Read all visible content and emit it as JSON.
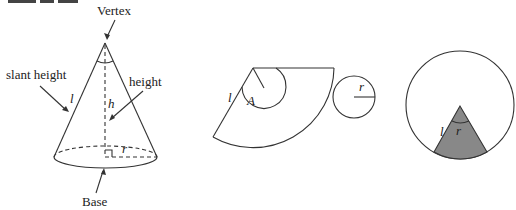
{
  "title_clipped": "CONE",
  "cone": {
    "vertex_label": "Vertex",
    "slant_label": "slant height",
    "height_label": "height",
    "base_label": "Base",
    "l": "l",
    "h": "h",
    "r": "r"
  },
  "net": {
    "l": "l",
    "A": "A",
    "r": "r"
  },
  "circle_sector": {
    "l": "l",
    "r": "r",
    "shade_color": "#888888"
  }
}
